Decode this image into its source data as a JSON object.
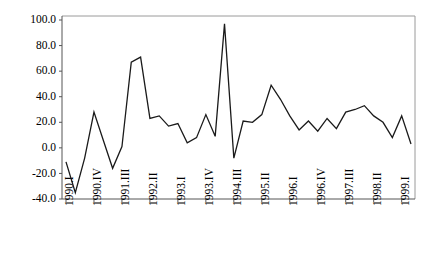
{
  "chart_data": {
    "type": "line",
    "title": "",
    "xlabel": "",
    "ylabel": "",
    "ylim": [
      -40.0,
      100.0
    ],
    "ytick_values": [
      -40.0,
      -20.0,
      0.0,
      20.0,
      40.0,
      60.0,
      80.0,
      100.0
    ],
    "ytick_labels": [
      "-40.0",
      "-20.0",
      "0.0",
      "20.0",
      "40.0",
      "60.0",
      "80.0",
      "100.0"
    ],
    "grid": false,
    "legend": null,
    "x": [
      "1990.I",
      "1990.II",
      "1990.III",
      "1990.IV",
      "1991.I",
      "1991.II",
      "1991.III",
      "1991.IV",
      "1992.I",
      "1992.II",
      "1992.III",
      "1992.IV",
      "1993.I",
      "1993.II",
      "1993.III",
      "1993.IV",
      "1994.I",
      "1994.II",
      "1994.III",
      "1994.IV",
      "1995.I",
      "1995.II",
      "1995.III",
      "1995.IV",
      "1996.I",
      "1996.II",
      "1996.III",
      "1996.IV",
      "1997.I",
      "1997.II",
      "1997.III",
      "1997.IV",
      "1998.I",
      "1998.II",
      "1998.III",
      "1998.IV",
      "1999.I",
      "1999.II"
    ],
    "xtick_labels": [
      "1990.I",
      "1990.IV",
      "1991.III",
      "1992.II",
      "1993.I",
      "1993.IV",
      "1994.III",
      "1995.II",
      "1996.I",
      "1996.IV",
      "1997.III",
      "1998.II",
      "1999.I"
    ],
    "xtick_every": 3,
    "values": [
      -11,
      -35,
      -8,
      28,
      6,
      -16,
      1,
      67,
      71,
      23,
      25,
      17,
      19,
      4,
      8,
      26,
      9,
      97,
      -8,
      21,
      20,
      26,
      49,
      38,
      25,
      14,
      21,
      13,
      23,
      15,
      28,
      30,
      33,
      25,
      20,
      8,
      25,
      3
    ],
    "series": [
      {
        "name": "series-1",
        "values": [
          -11,
          -35,
          -8,
          28,
          6,
          -16,
          1,
          67,
          71,
          23,
          25,
          17,
          19,
          4,
          8,
          26,
          9,
          97,
          -8,
          21,
          20,
          26,
          49,
          38,
          25,
          14,
          21,
          13,
          23,
          15,
          28,
          30,
          33,
          25,
          20,
          8,
          25,
          3
        ]
      }
    ],
    "line_color": "#1a1a1a",
    "frame_color": "#9a9a9a",
    "axis_color": "#555555"
  }
}
